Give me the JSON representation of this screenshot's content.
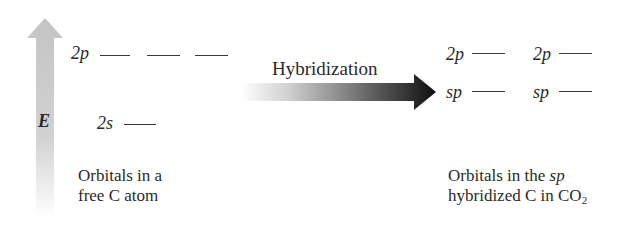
{
  "energy_axis": {
    "label": "E",
    "color_top": "#c8c8c8",
    "color_bottom": "#ffffff"
  },
  "free_atom": {
    "levels": [
      {
        "label": "2p",
        "count": 3
      },
      {
        "label": "2s",
        "count": 1
      }
    ],
    "caption_line1": "Orbitals in a",
    "caption_line2": "free C atom"
  },
  "process": {
    "label": "Hybridization",
    "arrow_color_start": "#ffffff",
    "arrow_color_end": "#111111"
  },
  "hybridized": {
    "levels": [
      {
        "label": "2p",
        "count": 2
      },
      {
        "label": "sp",
        "count": 2
      }
    ],
    "caption_line1_prefix": "Orbitals in the ",
    "caption_line1_italic": "sp",
    "caption_line2_prefix": "hybridized C in CO",
    "caption_line2_sub": "2"
  }
}
